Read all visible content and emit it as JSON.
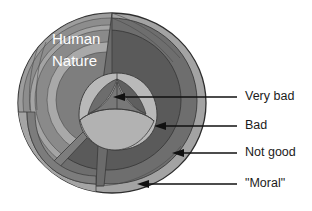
{
  "figure": {
    "kind": "cutaway-sphere-diagram",
    "title": {
      "line1": "Human",
      "line2": "Nature",
      "color": "#ffffff"
    },
    "callouts": [
      {
        "id": "very-bad",
        "label": "Very bad",
        "arrow": "left",
        "target_layer": "core"
      },
      {
        "id": "bad",
        "label": "Bad",
        "arrow": "left",
        "target_layer": "inner-shell"
      },
      {
        "id": "not-good",
        "label": "Not good",
        "arrow": "left",
        "target_layer": "mid-shell"
      },
      {
        "id": "moral",
        "label": "\"Moral\"",
        "arrow": "left",
        "target_layer": "outer-shell"
      }
    ],
    "layers": [
      {
        "name": "outer-shell",
        "label": "\"Moral\"",
        "color": "#9a9a9a"
      },
      {
        "name": "mid-shell",
        "label": "Not good",
        "color": "#6e6e6e"
      },
      {
        "name": "inner-shell",
        "label": "Bad",
        "color": "#585858"
      },
      {
        "name": "core",
        "label": "Very bad",
        "color": "#6a6a6a"
      },
      {
        "name": "core-face",
        "label": "",
        "color": "#b4b4b4"
      }
    ],
    "palette": {
      "background": "#ffffff",
      "shell_outer": "#9a9a9a",
      "shell_outer_light": "#a8a8a8",
      "shell_mid": "#6e6e6e",
      "shell_inner": "#585858",
      "cut_face_light": "#aeaeae",
      "cut_face_mid": "#8c8c8c",
      "cut_face_dark": "#7a7a7a",
      "core_cap": "#b8b8b8",
      "core_dark": "#666666",
      "line": "#111111",
      "edge": "#3a3a3a"
    }
  }
}
